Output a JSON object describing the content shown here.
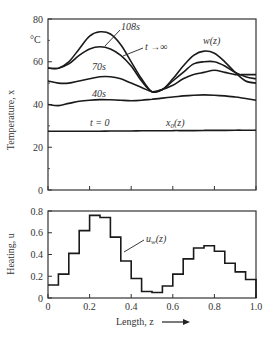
{
  "chart_data": [
    {
      "type": "line",
      "title": "",
      "xlabel": "",
      "ylabel": "Temperature, x",
      "yunit": "°C",
      "xlim": [
        0,
        1.0
      ],
      "ylim": [
        0,
        80
      ],
      "yticks": [
        0,
        20,
        40,
        60,
        80
      ],
      "grid": false,
      "x": [
        0,
        0.05,
        0.1,
        0.15,
        0.2,
        0.25,
        0.3,
        0.35,
        0.4,
        0.45,
        0.5,
        0.55,
        0.6,
        0.65,
        0.7,
        0.75,
        0.8,
        0.85,
        0.9,
        0.95,
        1.0
      ],
      "series": [
        {
          "name": "t → ∞",
          "values": [
            57,
            57,
            60,
            66,
            72,
            74,
            73,
            68,
            60,
            52,
            46,
            47,
            52,
            58,
            63,
            65,
            64,
            60,
            55,
            51,
            50
          ]
        },
        {
          "name": "108s",
          "values": [
            57,
            57,
            59,
            63,
            66,
            67,
            66,
            63,
            58,
            51,
            46,
            47,
            51,
            55,
            59,
            60,
            60,
            58,
            55,
            53,
            52
          ]
        },
        {
          "name": "70s",
          "values": [
            51,
            50,
            50,
            51,
            52,
            53,
            53,
            52,
            50,
            48,
            46,
            47,
            49,
            52,
            54,
            55,
            56,
            55,
            54,
            54,
            54
          ]
        },
        {
          "name": "40s",
          "values": [
            40,
            39.5,
            40.5,
            41.5,
            42,
            42.3,
            42.2,
            42,
            41.8,
            42,
            42.5,
            43,
            43.5,
            44,
            44.3,
            44.5,
            44.3,
            44,
            43.5,
            42.8,
            42
          ]
        },
        {
          "name": "t = 0  x0(z)",
          "values": [
            27.5,
            27.5,
            27.5,
            27.5,
            27.5,
            27.5,
            27.6,
            27.6,
            27.6,
            27.7,
            27.7,
            27.7,
            27.8,
            27.8,
            27.8,
            27.9,
            27.9,
            27.9,
            28,
            28,
            28
          ]
        }
      ],
      "annotations": [
        "108s",
        "t → ∞",
        "w(z)",
        "70s",
        "40s",
        "t = 0",
        "x0(z)"
      ]
    },
    {
      "type": "line",
      "style": "step",
      "title": "",
      "xlabel": "Length, z",
      "ylabel": "Heating, u",
      "xlim": [
        0,
        1.0
      ],
      "ylim": [
        0,
        0.8
      ],
      "xticks": [
        0,
        0.2,
        0.4,
        0.6,
        0.8,
        1.0
      ],
      "yticks": [
        0,
        0.2,
        0.4,
        0.6,
        0.8
      ],
      "grid": false,
      "step_width": 0.05,
      "series": [
        {
          "name": "u_w(z)",
          "values": [
            0.12,
            0.22,
            0.41,
            0.62,
            0.76,
            0.74,
            0.56,
            0.34,
            0.18,
            0.06,
            0.05,
            0.11,
            0.22,
            0.36,
            0.46,
            0.48,
            0.43,
            0.32,
            0.24,
            0.17
          ]
        }
      ],
      "annotations": [
        "u_w(z)"
      ]
    }
  ],
  "labels": {
    "top_ylabel": "Temperature, x",
    "top_unit": "°C",
    "bottom_ylabel": "Heating, u",
    "xlabel": "Length, z",
    "ann_108": "108s",
    "ann_inf": "t →∞",
    "ann_w": "w(z)",
    "ann_70": "70s",
    "ann_40": "40s",
    "ann_t0": "t = 0",
    "ann_x0": "x",
    "ann_x0_sub": "0",
    "ann_x0_tail": "(z)",
    "ann_u": "u",
    "ann_u_sub": "w",
    "ann_u_tail": "(z)"
  },
  "colors": {
    "line": "#1a1a1a",
    "axis": "#333333",
    "text": "#333333"
  }
}
